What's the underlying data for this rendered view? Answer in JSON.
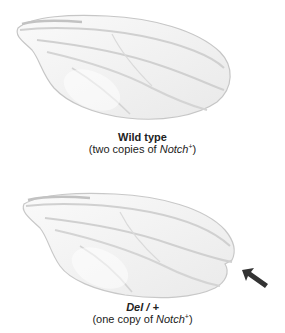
{
  "panels": [
    {
      "title": "Wild type",
      "subtitle_prefix": "(two copies of ",
      "gene": "Notch",
      "superscript": "+",
      "subtitle_suffix": ")"
    },
    {
      "title": "Del / +",
      "subtitle_prefix": "(one copy of ",
      "gene": "Notch",
      "superscript": "+",
      "subtitle_suffix": ")",
      "annotation": "arrow-pointing-to-wing-notch"
    }
  ],
  "colors": {
    "wing_fill": "#f2f2f2",
    "wing_stroke": "#c8c8c8",
    "vein": "#d4d4d4",
    "arrow": "#333333",
    "text": "#222222"
  }
}
